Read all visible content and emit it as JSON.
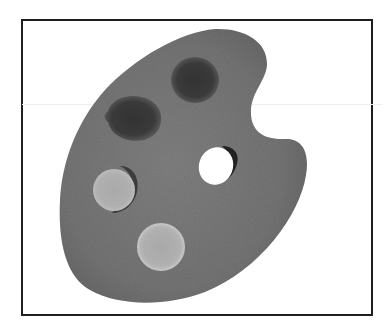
{
  "image": {
    "subject": "artist paint palette",
    "style": "grayscale photograph in black frame",
    "alt": "Artist's paint palette with thumb hole and paint dabs"
  },
  "colors": {
    "background": "#ffffff",
    "frame_border": "#1e1e1e",
    "palette_wood": "#7a7a7a",
    "palette_wood_dark": "#666666",
    "paint_dark_1": "#3a3a3a",
    "paint_dark_2": "#363636",
    "paint_light_1": "#b4b4b4",
    "paint_light_2": "#a8a8a8",
    "thumb_hole": "#ffffff"
  },
  "elements": {
    "paint_dabs": [
      {
        "name": "dark-paint-top",
        "tone": "dark"
      },
      {
        "name": "dark-paint-left",
        "tone": "dark"
      },
      {
        "name": "light-paint-middle",
        "tone": "light"
      },
      {
        "name": "light-paint-bottom",
        "tone": "light"
      }
    ],
    "thumb_hole": {
      "name": "thumb-hole"
    }
  }
}
